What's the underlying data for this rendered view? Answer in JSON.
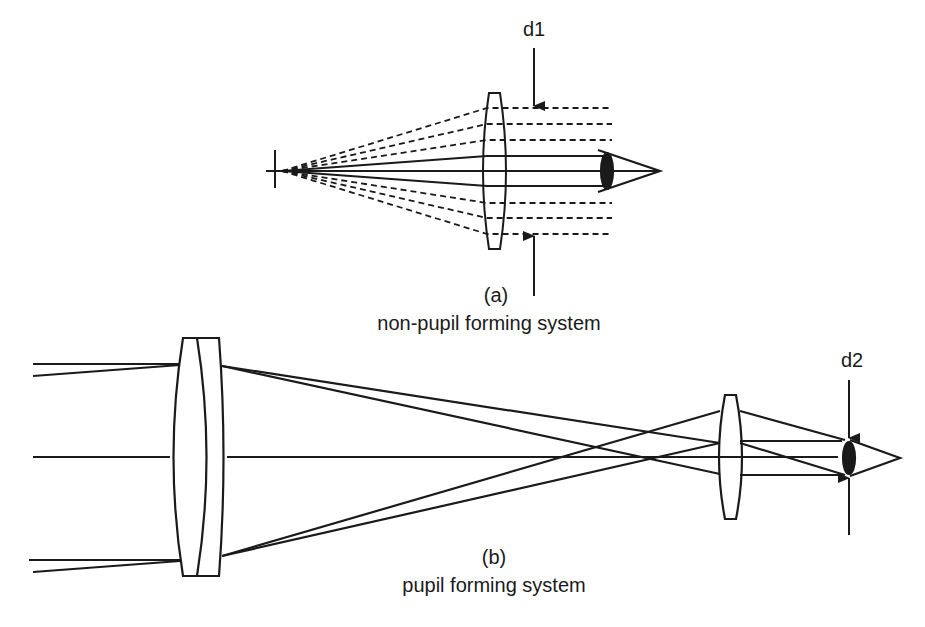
{
  "diagram": {
    "panel_a": {
      "label": "(a)",
      "caption": "non-pupil forming system",
      "dimension_label": "d1",
      "elements": [
        "object-point",
        "single-lens",
        "dashed-ray-fan",
        "solid-ray-bundle",
        "eye",
        "d1-arrows"
      ]
    },
    "panel_b": {
      "label": "(b)",
      "caption": "pupil forming system",
      "dimension_label": "d2",
      "elements": [
        "incoming-ray-bundles",
        "doublet-objective-lens",
        "crossing-rays",
        "eyepiece-lens",
        "eye",
        "d2-arrows"
      ]
    },
    "colors": {
      "stroke": "#1a1a1a",
      "background": "#ffffff"
    }
  }
}
